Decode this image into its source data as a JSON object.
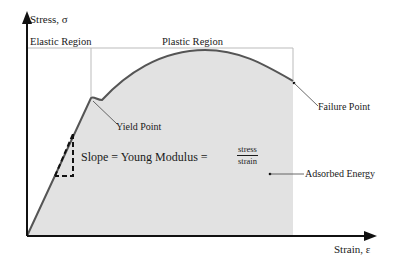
{
  "diagram": {
    "axes": {
      "y_label": "Stress, σ",
      "x_label": "Strain, ε"
    },
    "regions": {
      "elastic": "Elastic Region",
      "plastic": "Plastic Region"
    },
    "annotations": {
      "yield_point": "Yield Point",
      "failure_point": "Failure Point",
      "absorbed_energy": "Adsorbed Energy"
    },
    "slope_equation": {
      "lhs": "Slope = Young Modulus =",
      "numerator": "stress",
      "denominator": "strain"
    },
    "colors": {
      "curve": "#555555",
      "fill": "#e2e2e2",
      "axis": "#111111",
      "frame": "#bbbbbb"
    }
  }
}
